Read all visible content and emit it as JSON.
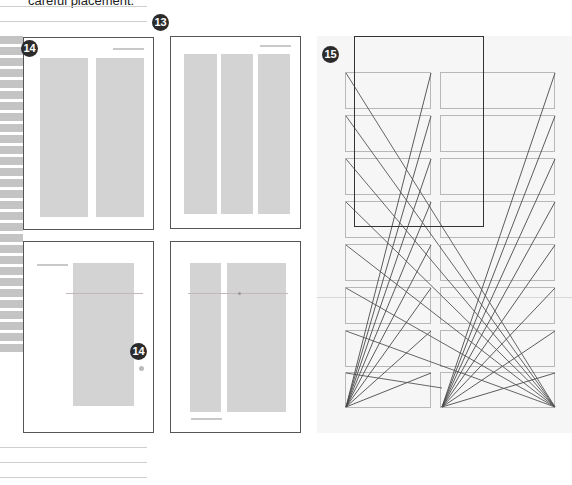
{
  "caption": {
    "text": "careful placement."
  },
  "badges": [
    {
      "label": "13"
    },
    {
      "label": "14"
    },
    {
      "label": "14"
    },
    {
      "label": "15"
    }
  ],
  "pages": [
    {
      "name": "two-column-layout",
      "columns": 2,
      "title_rule": "top-right"
    },
    {
      "name": "three-column-layout",
      "columns": 3,
      "title_rule": "top-right"
    },
    {
      "name": "single-column-offset-layout",
      "columns": 1,
      "title_rule": "top-left"
    },
    {
      "name": "narrow-wide-column-layout",
      "columns": 2,
      "title_rule": "bottom-left"
    }
  ],
  "grid_diagram": {
    "columns": 2,
    "rows": 8,
    "description": "Modular grid with diagonal construction lines"
  },
  "colors": {
    "badge": "#2b2b2b",
    "column_fill": "#d3d3d3",
    "page_border": "#555555",
    "panel_bg": "#f6f6f6",
    "grid_box": "#b8b8b8",
    "diagonal": "#555555"
  }
}
